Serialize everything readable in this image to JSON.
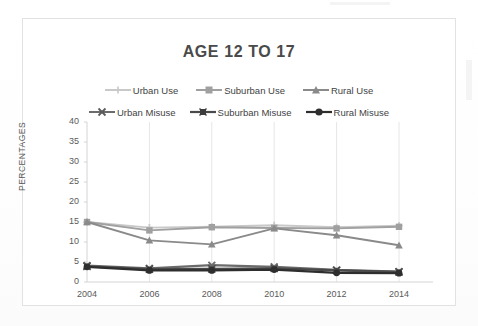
{
  "chart_data": {
    "type": "line",
    "title": "AGE 12 TO 17",
    "xlabel": "",
    "ylabel": "PERCENTAGES",
    "x": [
      2004,
      2006,
      2008,
      2010,
      2012,
      2014
    ],
    "xticklabels": [
      "2004",
      "2006",
      "2008",
      "2010",
      "2012",
      "2014"
    ],
    "yticklabels": [
      "0",
      "5",
      "10",
      "15",
      "20",
      "25",
      "30",
      "35",
      "40"
    ],
    "yticks": [
      0,
      5,
      10,
      15,
      20,
      25,
      30,
      35,
      40
    ],
    "ylim": [
      0,
      40
    ],
    "grid": "vertical-only",
    "legend_position": "top",
    "series": [
      {
        "name": "Urban Use",
        "marker": "plus",
        "color": "#c9c9c9",
        "values": [
          15.0,
          13.6,
          13.8,
          14.2,
          13.7,
          14.1
        ]
      },
      {
        "name": "Suburban Use",
        "marker": "square",
        "color": "#a0a0a0",
        "values": [
          15.0,
          12.9,
          13.7,
          13.5,
          13.4,
          13.8
        ]
      },
      {
        "name": "Rural Use",
        "marker": "triangle",
        "color": "#8a8a8a",
        "values": [
          15.0,
          10.4,
          9.4,
          13.4,
          11.7,
          9.2
        ]
      },
      {
        "name": "Urban Misuse",
        "marker": "x",
        "color": "#6b6b6b",
        "values": [
          4.1,
          3.4,
          4.2,
          3.8,
          3.0,
          2.6
        ]
      },
      {
        "name": "Suburban Misuse",
        "marker": "star",
        "color": "#4a4a4a",
        "values": [
          3.9,
          3.2,
          3.3,
          3.4,
          2.9,
          2.5
        ]
      },
      {
        "name": "Rural Misuse",
        "marker": "circle",
        "color": "#2e2e2e",
        "values": [
          3.8,
          2.9,
          2.9,
          3.1,
          2.3,
          2.2
        ]
      }
    ]
  }
}
